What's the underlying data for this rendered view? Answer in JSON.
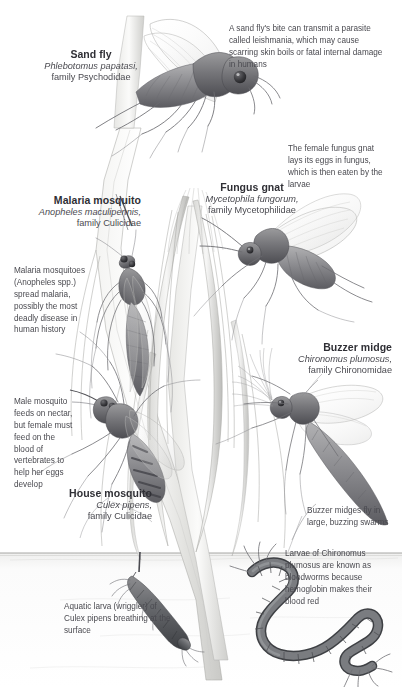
{
  "plate": {
    "title": "Flies, gnats, mosquitoes and midges",
    "background_color": "#ffffff",
    "text_color": "#4a4a50",
    "heading_color": "#2f2f35",
    "water_line_label": "water surface"
  },
  "species": [
    {
      "id": "sand-fly",
      "common_name": "Sand fly",
      "latin_name": "Phlebotomus papatasi,",
      "family": "family Psychodidae",
      "align": "center"
    },
    {
      "id": "malaria-mosquito",
      "common_name": "Malaria mosquito",
      "latin_name": "Anopheles maculipennis,",
      "family": "family Culicidae",
      "align": "right"
    },
    {
      "id": "fungus-gnat",
      "common_name": "Fungus gnat",
      "latin_name": "Mycetophila fungorum,",
      "family": "family Mycetophilidae",
      "align": "center"
    },
    {
      "id": "buzzer-midge",
      "common_name": "Buzzer midge",
      "latin_name": "Chironomus plumosus,",
      "family": "family Chironomidae",
      "align": "right"
    },
    {
      "id": "house-mosquito",
      "common_name": "House mosquito",
      "latin_name": "Culex pipens,",
      "family": "family Culicidae",
      "align": "right"
    }
  ],
  "notes": [
    {
      "id": "sand-fly-note",
      "text": "A sand fly's bite can transmit a parasite called leishmania, which may cause scarring skin boils or fatal internal damage in humans",
      "align": "left"
    },
    {
      "id": "fungus-gnat-note",
      "text": "The female fungus gnat lays its eggs in fungus, which is then eaten by the larvae",
      "align": "left"
    },
    {
      "id": "malaria-mosquito-note",
      "text": "Malaria mosquitoes (Anopheles spp.) spread malaria, possibly the most deadly disease in human history",
      "align": "left"
    },
    {
      "id": "male-mosquito-note",
      "text": "Male mosquito feeds on nectar, but female must feed on the blood of vertebrates to help her eggs develop",
      "align": "left"
    },
    {
      "id": "buzzer-swarm-note",
      "text": "Buzzer midges fly in large, buzzing swarms",
      "align": "left"
    },
    {
      "id": "bloodworm-note",
      "text": "Larvae of Chironomus plumosus are known as bloodworms because hemoglobin makes their blood red",
      "align": "left"
    },
    {
      "id": "wriggler-note",
      "text": "Aquatic larva (wriggler) of Culex pipens breathing at the surface",
      "align": "left"
    }
  ]
}
